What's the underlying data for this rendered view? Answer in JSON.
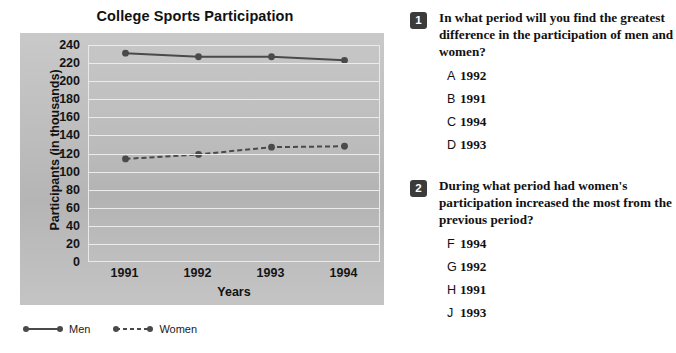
{
  "chart_data": {
    "type": "line",
    "title": "College Sports Participation",
    "xlabel": "Years",
    "ylabel": "Participants (in thousands)",
    "categories": [
      "1991",
      "1992",
      "1993",
      "1994"
    ],
    "series": [
      {
        "name": "Men",
        "values": [
          231,
          227,
          227,
          223
        ],
        "style": "solid",
        "color": "#4a4a4a"
      },
      {
        "name": "Women",
        "values": [
          114,
          119,
          127,
          128
        ],
        "style": "dashed",
        "color": "#4a4a4a"
      }
    ],
    "ylim": [
      0,
      240
    ],
    "ytick_step": 20,
    "yticks": [
      "240",
      "220",
      "200",
      "180",
      "160",
      "140",
      "120",
      "100",
      "80",
      "60",
      "40",
      "20",
      "0"
    ],
    "grid": true,
    "legend_position": "bottom-left",
    "plot_background": "#bdbdbd"
  },
  "legend": {
    "men_label": "Men",
    "women_label": "Women"
  },
  "questions": [
    {
      "number": "1",
      "stem": "In what period will you find the greatest difference in the participation of men and women?",
      "options": [
        {
          "letter": "A",
          "text": "1992"
        },
        {
          "letter": "B",
          "text": "1991"
        },
        {
          "letter": "C",
          "text": "1994"
        },
        {
          "letter": "D",
          "text": "1993"
        }
      ]
    },
    {
      "number": "2",
      "stem": "During what period had women's participation increased the most from the previous period?",
      "options": [
        {
          "letter": "F",
          "text": "1994"
        },
        {
          "letter": "G",
          "text": "1992"
        },
        {
          "letter": "H",
          "text": "1991"
        },
        {
          "letter": "J",
          "text": "1993"
        }
      ]
    }
  ]
}
